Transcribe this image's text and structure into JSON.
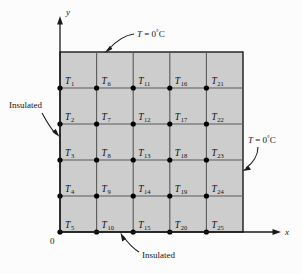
{
  "figure": {
    "colors": {
      "background": "#fcfcfc",
      "grid_fill": "#cdcdcd",
      "grid_line": "#555555",
      "outline": "#1a1a1a",
      "node": "#000000",
      "text": "#141414"
    },
    "axes": {
      "x_label": "x",
      "y_label": "y",
      "origin_label": "0"
    },
    "grid": {
      "rows": 5,
      "cols": 5,
      "origin_x": 60,
      "origin_y": 232,
      "top_y": 52,
      "right_x": 243,
      "cell_w": 36.6,
      "cell_h": 36
    },
    "nodes": [
      {
        "label": "T",
        "sub": "1",
        "col": 0,
        "row": 0
      },
      {
        "label": "T",
        "sub": "2",
        "col": 0,
        "row": 1
      },
      {
        "label": "T",
        "sub": "3",
        "col": 0,
        "row": 2
      },
      {
        "label": "T",
        "sub": "4",
        "col": 0,
        "row": 3
      },
      {
        "label": "T",
        "sub": "5",
        "col": 0,
        "row": 4
      },
      {
        "label": "T",
        "sub": "6",
        "col": 1,
        "row": 0
      },
      {
        "label": "T",
        "sub": "7",
        "col": 1,
        "row": 1
      },
      {
        "label": "T",
        "sub": "8",
        "col": 1,
        "row": 2
      },
      {
        "label": "T",
        "sub": "9",
        "col": 1,
        "row": 3
      },
      {
        "label": "T",
        "sub": "10",
        "col": 1,
        "row": 4
      },
      {
        "label": "T",
        "sub": "11",
        "col": 2,
        "row": 0
      },
      {
        "label": "T",
        "sub": "12",
        "col": 2,
        "row": 1
      },
      {
        "label": "T",
        "sub": "13",
        "col": 2,
        "row": 2
      },
      {
        "label": "T",
        "sub": "14",
        "col": 2,
        "row": 3
      },
      {
        "label": "T",
        "sub": "15",
        "col": 2,
        "row": 4
      },
      {
        "label": "T",
        "sub": "16",
        "col": 3,
        "row": 0
      },
      {
        "label": "T",
        "sub": "17",
        "col": 3,
        "row": 1
      },
      {
        "label": "T",
        "sub": "18",
        "col": 3,
        "row": 2
      },
      {
        "label": "T",
        "sub": "19",
        "col": 3,
        "row": 3
      },
      {
        "label": "T",
        "sub": "20",
        "col": 3,
        "row": 4
      },
      {
        "label": "T",
        "sub": "21",
        "col": 4,
        "row": 0
      },
      {
        "label": "T",
        "sub": "22",
        "col": 4,
        "row": 1
      },
      {
        "label": "T",
        "sub": "23",
        "col": 4,
        "row": 2
      },
      {
        "label": "T",
        "sub": "24",
        "col": 4,
        "row": 3
      },
      {
        "label": "T",
        "sub": "25",
        "col": 4,
        "row": 4
      }
    ],
    "annotations": {
      "top_bc_prefix": "T",
      "top_bc_eq": " = 0",
      "top_bc_deg": "°",
      "top_bc_unit": "C",
      "right_bc_prefix": "T",
      "right_bc_eq": " = 0",
      "right_bc_deg": "°",
      "right_bc_unit": "C",
      "left_bc": "Insulated",
      "bottom_bc": "Insulated"
    }
  }
}
